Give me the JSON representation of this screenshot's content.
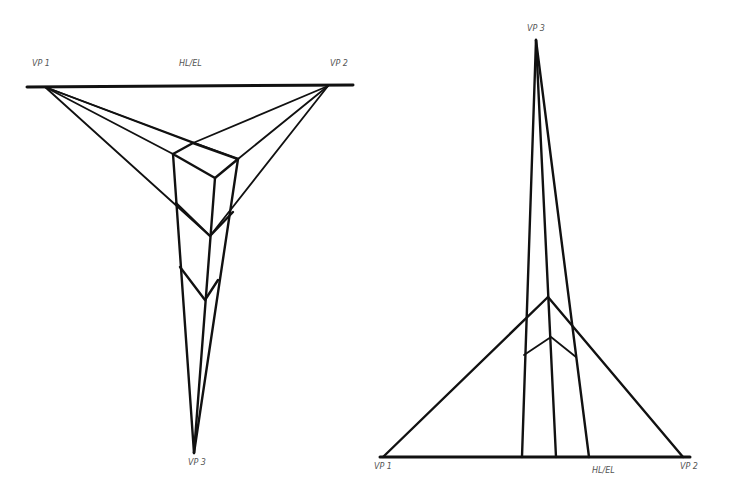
{
  "left_figure": {
    "title": "Three-point perspective (bird's-eye view)",
    "labels": {
      "vp1": "VP 1",
      "horizon": "HL/EL",
      "vp2": "VP 2",
      "vp3": "VP 3"
    }
  },
  "right_figure": {
    "title": "Three-point perspective (worm's-eye view)",
    "labels": {
      "vp3": "VP 3",
      "vp1": "VP 1",
      "horizon": "HL/EL",
      "vp2": "VP 2"
    }
  },
  "colors": {
    "line": "#111111",
    "label": "#555555",
    "background": "#ffffff"
  }
}
